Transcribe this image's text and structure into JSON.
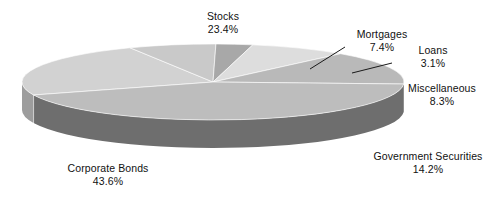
{
  "chart_data": {
    "type": "pie",
    "title": "",
    "subtitle": "",
    "xlabel": "",
    "ylabel": "",
    "legend_position": "none",
    "grid": false,
    "three_d": true,
    "categories": [
      "Stocks",
      "Mortgages",
      "Loans",
      "Miscellaneous",
      "Government Securities",
      "Corporate Bonds"
    ],
    "values": [
      23.4,
      7.4,
      3.1,
      8.3,
      14.2,
      43.6
    ],
    "value_unit": "%",
    "slices": [
      {
        "name": "Stocks",
        "label": "Stocks",
        "value": 23.4,
        "percent_text": "23.4%",
        "color": "#d2d2d2",
        "side_color": "#9d9d9d",
        "start_pct": 0.0,
        "end_pct": 23.4,
        "leader_line": false
      },
      {
        "name": "Mortgages",
        "label": "Mortgages",
        "value": 7.4,
        "percent_text": "7.4%",
        "color": "#c9c9c9",
        "side_color": "#959595",
        "start_pct": 23.4,
        "end_pct": 30.8,
        "leader_line": true
      },
      {
        "name": "Loans",
        "label": "Loans",
        "value": 3.1,
        "percent_text": "3.1%",
        "color": "#a8a8a8",
        "side_color": "#808080",
        "start_pct": 30.8,
        "end_pct": 33.9,
        "leader_line": true
      },
      {
        "name": "Miscellaneous",
        "label": "Miscellaneous",
        "value": 8.3,
        "percent_text": "8.3%",
        "color": "#dddddd",
        "side_color": "#a6a6a6",
        "start_pct": 33.9,
        "end_pct": 42.2,
        "leader_line": false
      },
      {
        "name": "Government Securities",
        "label": "Government Securities",
        "value": 14.2,
        "percent_text": "14.2%",
        "color": "#b9b9b9",
        "side_color": "#8e8e8e",
        "start_pct": 42.2,
        "end_pct": 56.4,
        "leader_line": false
      },
      {
        "name": "Corporate Bonds",
        "label": "Corporate Bonds",
        "value": 43.6,
        "percent_text": "43.6%",
        "color": "#bdbdbd",
        "side_color": "#6e6e6e",
        "start_pct": 56.4,
        "end_pct": 100.0,
        "leader_line": false
      }
    ],
    "background_color": "#ffffff",
    "label_color": "#111111",
    "total": 100.0
  }
}
